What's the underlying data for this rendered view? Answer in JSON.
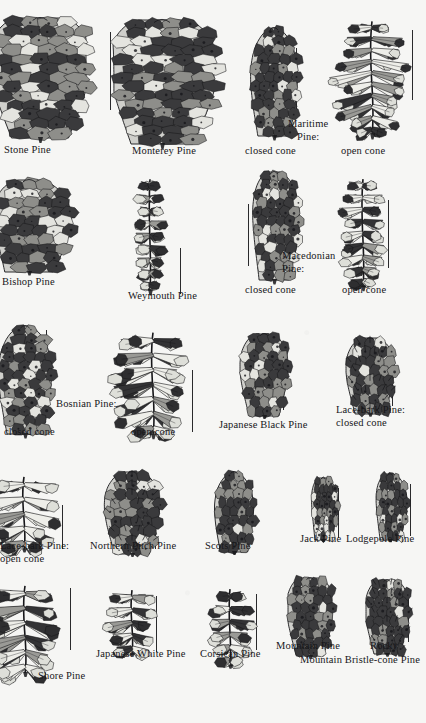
{
  "plate": {
    "title": "Pine Cones",
    "background_color": "#f6f6f4",
    "ink_color": "#17171a",
    "style": "black-and-white engraving / line-drawing botanical plate"
  },
  "rows": [
    {
      "row_index": 1,
      "specimens": [
        {
          "name": "Stone Pine",
          "label": "Stone Pine",
          "label_align": "center",
          "cone_type": "closed",
          "shape": "ovoid-round",
          "clipped_edge": "left",
          "scale_bar": false
        },
        {
          "name": "Monterey Pine",
          "label": "Monterey Pine",
          "label_align": "center",
          "cone_type": "closed",
          "shape": "ovoid-broad",
          "clipped_edge": "none",
          "scale_bar": true
        },
        {
          "name": "Maritime Pine closed cone",
          "label": "closed cone",
          "label_align": "center",
          "cone_type": "closed",
          "shape": "conic-narrow",
          "clipped_edge": "none",
          "scale_bar": true
        },
        {
          "name": "Maritime Pine open cone",
          "label": "open cone",
          "label_align": "center",
          "cone_type": "open",
          "shape": "conic-broad",
          "clipped_edge": "none",
          "scale_bar": true
        }
      ],
      "group_label": {
        "lines": [
          "Maritime",
          "Pine:"
        ],
        "align": "center"
      }
    },
    {
      "row_index": 2,
      "specimens": [
        {
          "name": "Bishop Pine",
          "label": "Bishop Pine",
          "label_align": "left",
          "cone_type": "closed",
          "shape": "oblique-knobby",
          "clipped_edge": "left",
          "scale_bar": true
        },
        {
          "name": "Weymouth Pine",
          "label": "Weymouth Pine",
          "label_align": "center",
          "cone_type": "open",
          "shape": "long-cylindric",
          "clipped_edge": "none",
          "scale_bar": true
        },
        {
          "name": "Macedonian Pine closed cone",
          "label": "closed cone",
          "label_align": "center",
          "cone_type": "closed",
          "shape": "long-curved",
          "clipped_edge": "none",
          "scale_bar": true
        },
        {
          "name": "Macedonian Pine open cone",
          "label": "open cone",
          "label_align": "center",
          "cone_type": "open",
          "shape": "long-open",
          "clipped_edge": "none",
          "scale_bar": true
        }
      ],
      "group_label": {
        "lines": [
          "Macedonian",
          "Pine:"
        ],
        "align": "left"
      }
    },
    {
      "row_index": 3,
      "specimens": [
        {
          "name": "Bosnian Pine closed cone",
          "label": "closed cone",
          "label_align": "center",
          "cone_type": "closed",
          "shape": "conic-narrow",
          "clipped_edge": "left",
          "scale_bar": true
        },
        {
          "name": "Bosnian Pine open cone",
          "label": "open cone",
          "label_align": "center",
          "cone_type": "open",
          "shape": "star-open",
          "clipped_edge": "none",
          "scale_bar": true
        },
        {
          "name": "Japanese Black Pine",
          "label": "Japanese Black Pine",
          "label_align": "center",
          "cone_type": "closed",
          "shape": "ovoid-small",
          "clipped_edge": "none",
          "scale_bar": true
        }
      ],
      "group_label": {
        "lines": [
          "Bosnian Pine:"
        ],
        "align": "center"
      },
      "right_specimen": {
        "name": "Lace-bark Pine closed cone",
        "label_lines": [
          "Lace-bark Pine:",
          "closed cone"
        ],
        "label_align": "left",
        "cone_type": "closed",
        "shape": "ovoid-bristly",
        "scale_bar": true
      }
    },
    {
      "row_index": 4,
      "specimens": [
        {
          "name": "Lace-bark Pine open cone",
          "label_lines": [
            "Lace-bark Pine:",
            "open cone"
          ],
          "label_align": "left",
          "cone_type": "open",
          "shape": "rosette-open",
          "clipped_edge": "left",
          "scale_bar": true
        },
        {
          "name": "Northern Pitch Pine",
          "label": "Northern Pitch Pine",
          "label_align": "center",
          "cone_type": "closed",
          "shape": "ovoid-spiny",
          "clipped_edge": "none",
          "scale_bar": true
        },
        {
          "name": "Scots Pine",
          "label": "Scots Pine",
          "label_align": "center",
          "cone_type": "closed",
          "shape": "conic-pointed",
          "clipped_edge": "none",
          "scale_bar": false
        },
        {
          "name": "Jack Pine",
          "label": "Jack Pine",
          "label_align": "center",
          "cone_type": "closed",
          "shape": "curved-small",
          "clipped_edge": "none",
          "scale_bar": true
        },
        {
          "name": "Lodgepole Pine",
          "label": "Lodgepole Pine",
          "label_align": "center",
          "cone_type": "closed",
          "shape": "oblique-small",
          "clipped_edge": "none",
          "scale_bar": true
        }
      ]
    },
    {
      "row_index": 5,
      "specimens": [
        {
          "name": "Shore Pine",
          "label": "Shore Pine",
          "label_align": "center",
          "cone_type": "open",
          "shape": "rosette-open",
          "clipped_edge": "left",
          "scale_bar": true
        },
        {
          "name": "Japanese White Pine",
          "label": "Japanese White Pine",
          "label_align": "center",
          "cone_type": "open",
          "shape": "rosette-small",
          "clipped_edge": "none",
          "scale_bar": true
        },
        {
          "name": "Corsican Pine",
          "label": "Corsican Pine",
          "label_align": "center",
          "cone_type": "open",
          "shape": "ovoid-open",
          "clipped_edge": "none",
          "scale_bar": true
        },
        {
          "name": "Mountain Pine",
          "label": "Mountain Pine",
          "label_align": "center",
          "cone_type": "closed",
          "shape": "ovoid-dark",
          "clipped_edge": "none",
          "scale_bar": true
        },
        {
          "name": "Rocky Mountain Bristle-cone Pine",
          "label_lines": [
            "Rocky",
            "Mountain Bristle-cone Pine"
          ],
          "label_align": "center",
          "cone_type": "closed",
          "shape": "ovoid-bristly",
          "clipped_edge": "right",
          "scale_bar": true
        }
      ]
    }
  ]
}
